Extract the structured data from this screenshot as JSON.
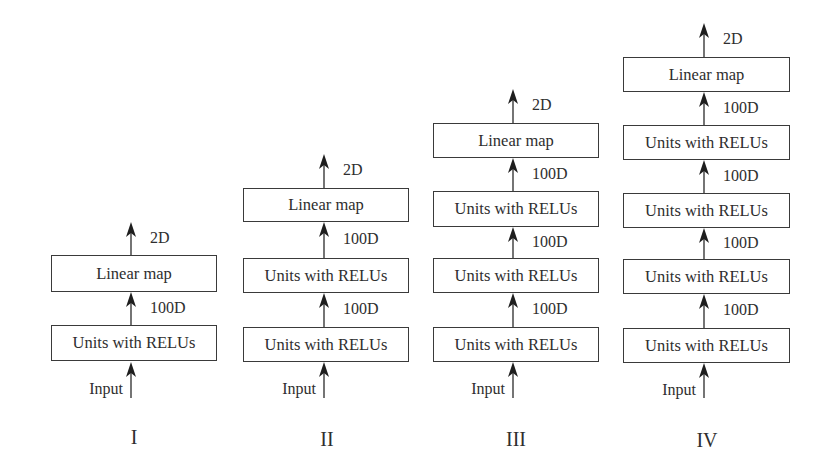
{
  "figure": {
    "colors": {
      "stroke": "#3a3a3a",
      "text": "#2e2e2e",
      "background": "#ffffff"
    },
    "columns": [
      {
        "id": "I",
        "label": "I",
        "arrow_x": 131,
        "box_left": 51,
        "box_right": 217,
        "label_y": 427,
        "input": {
          "text": "Input",
          "arrow_top": 362,
          "arrow_bottom": 398,
          "text_y": 381
        },
        "layers": [
          {
            "name": "units-with-relus",
            "text": "Units with RELUs",
            "top": 325,
            "bottom": 361
          },
          {
            "name": "linear-map",
            "text": "Linear map",
            "top": 255,
            "bottom": 292
          }
        ],
        "edges": [
          {
            "text": "100D",
            "from": 325,
            "to": 292
          },
          {
            "text": "2D",
            "from": 255,
            "to": 222
          }
        ]
      },
      {
        "id": "II",
        "label": "II",
        "arrow_x": 324,
        "box_left": 243,
        "box_right": 409,
        "label_y": 429,
        "input": {
          "text": "Input",
          "arrow_top": 362,
          "arrow_bottom": 398,
          "text_y": 381
        },
        "layers": [
          {
            "name": "units-with-relus",
            "text": "Units with RELUs",
            "top": 327,
            "bottom": 362
          },
          {
            "name": "units-with-relus",
            "text": "Units with RELUs",
            "top": 258,
            "bottom": 293
          },
          {
            "name": "linear-map",
            "text": "Linear map",
            "top": 188,
            "bottom": 222
          }
        ],
        "edges": [
          {
            "text": "100D",
            "from": 327,
            "to": 293
          },
          {
            "text": "100D",
            "from": 258,
            "to": 222
          },
          {
            "text": "2D",
            "from": 188,
            "to": 154
          }
        ]
      },
      {
        "id": "III",
        "label": "III",
        "arrow_x": 513,
        "box_left": 433,
        "box_right": 599,
        "label_y": 429,
        "input": {
          "text": "Input",
          "arrow_top": 362,
          "arrow_bottom": 398,
          "text_y": 381
        },
        "layers": [
          {
            "name": "units-with-relus",
            "text": "Units with RELUs",
            "top": 327,
            "bottom": 362
          },
          {
            "name": "units-with-relus",
            "text": "Units with RELUs",
            "top": 258,
            "bottom": 293
          },
          {
            "name": "units-with-relus",
            "text": "Units with RELUs",
            "top": 191,
            "bottom": 227
          },
          {
            "name": "linear-map",
            "text": "Linear map",
            "top": 123,
            "bottom": 158
          }
        ],
        "edges": [
          {
            "text": "100D",
            "from": 327,
            "to": 293
          },
          {
            "text": "100D",
            "from": 258,
            "to": 227
          },
          {
            "text": "100D",
            "from": 191,
            "to": 158
          },
          {
            "text": "2D",
            "from": 123,
            "to": 89
          }
        ]
      },
      {
        "id": "IV",
        "label": "IV",
        "arrow_x": 704,
        "box_left": 623,
        "box_right": 790,
        "label_y": 430,
        "input": {
          "text": "Input",
          "arrow_top": 363,
          "arrow_bottom": 398,
          "text_y": 382
        },
        "layers": [
          {
            "name": "units-with-relus",
            "text": "Units with RELUs",
            "top": 328,
            "bottom": 363
          },
          {
            "name": "units-with-relus",
            "text": "Units with RELUs",
            "top": 259,
            "bottom": 294
          },
          {
            "name": "units-with-relus",
            "text": "Units with RELUs",
            "top": 193,
            "bottom": 228
          },
          {
            "name": "units-with-relus",
            "text": "Units with RELUs",
            "top": 125,
            "bottom": 160
          },
          {
            "name": "linear-map",
            "text": "Linear map",
            "top": 57,
            "bottom": 92
          }
        ],
        "edges": [
          {
            "text": "100D",
            "from": 328,
            "to": 294
          },
          {
            "text": "100D",
            "from": 259,
            "to": 228
          },
          {
            "text": "100D",
            "from": 193,
            "to": 160
          },
          {
            "text": "100D",
            "from": 125,
            "to": 92
          },
          {
            "text": "2D",
            "from": 57,
            "to": 23
          }
        ]
      }
    ]
  }
}
